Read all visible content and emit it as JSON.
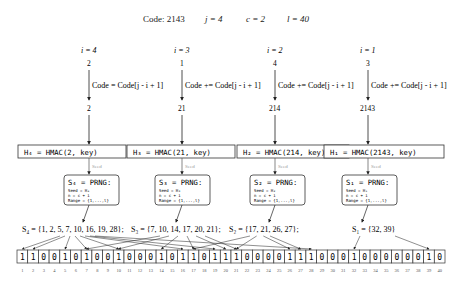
{
  "header": {
    "code_label": "Code: 2143",
    "j_label": "j = 4",
    "c_label": "c = 2",
    "l_label": "l = 40"
  },
  "stages": [
    {
      "i_label": "i = 4",
      "digit": "2",
      "op_label": "Code = Code[j - i + 1]",
      "code_value": "2",
      "hmac_label": "H₄ = HMAC(2, key)",
      "seed_label": "Seed",
      "prng_title": "S₄ = PRNG:",
      "prng_lines": [
        "Seed = H₄",
        "n = c + i",
        "Range = {1,...,l}"
      ],
      "set_label": "S₄ = {1, 2, 5, 7, 10, 16, 19, 28};",
      "set": [
        1,
        2,
        5,
        7,
        10,
        16,
        19,
        28
      ]
    },
    {
      "i_label": "i = 3",
      "digit": "1",
      "op_label": "Code += Code[j - i + 1]",
      "code_value": "21",
      "hmac_label": "H₃ = HMAC(21, key)",
      "seed_label": "Seed",
      "prng_title": "S₃ = PRNG:",
      "prng_lines": [
        "Seed = H₃",
        "n = c + i",
        "Range = {1,...,l}"
      ],
      "set_label": "S₃ = {7, 10, 14, 17, 20, 21};",
      "set": [
        7,
        10,
        14,
        17,
        20,
        21
      ]
    },
    {
      "i_label": "i = 2",
      "digit": "4",
      "op_label": "Code += Code[j - i + 1]",
      "code_value": "214",
      "hmac_label": "H₂ = HMAC(214, key)",
      "seed_label": "Seed",
      "prng_title": "S₂ = PRNG:",
      "prng_lines": [
        "Seed = H₂",
        "n = c + i",
        "Range = {1,...,l}"
      ],
      "set_label": "S₂ = {17, 21, 26, 27};",
      "set": [
        17,
        21,
        26,
        27
      ]
    },
    {
      "i_label": "i = 1",
      "digit": "3",
      "op_label": "Code += Code[j - i + 1]",
      "code_value": "2143",
      "hmac_label": "H₁ = HMAC(2143, key)",
      "seed_label": "Seed",
      "prng_title": "S₁ = PRNG:",
      "prng_lines": [
        "Seed = H₁",
        "n = c + i",
        "Range = {1,...,l}"
      ],
      "set_label": "S₁ = {32, 39}",
      "set": [
        32,
        39
      ]
    }
  ],
  "bit_array": {
    "bits": [
      1,
      1,
      0,
      0,
      1,
      0,
      1,
      0,
      0,
      1,
      0,
      0,
      0,
      1,
      0,
      1,
      1,
      0,
      1,
      1,
      1,
      0,
      0,
      0,
      0,
      1,
      1,
      1,
      0,
      0,
      0,
      1,
      0,
      0,
      0,
      0,
      0,
      0,
      1,
      0
    ],
    "indices": [
      1,
      2,
      3,
      4,
      5,
      6,
      7,
      8,
      9,
      10,
      11,
      12,
      13,
      14,
      15,
      16,
      17,
      18,
      19,
      20,
      21,
      22,
      23,
      24,
      25,
      26,
      27,
      28,
      29,
      30,
      31,
      32,
      33,
      34,
      35,
      36,
      37,
      38,
      39,
      40
    ]
  },
  "colors": {
    "line": "#222222",
    "seed_text": "#999999",
    "box_border": "#333333"
  }
}
